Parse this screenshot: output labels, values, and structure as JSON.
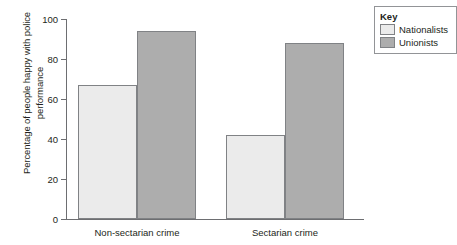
{
  "chart_data": {
    "type": "bar",
    "title": "",
    "xlabel": "",
    "ylabel": "Percentage of people happy with police performance",
    "categories": [
      "Non-sectarian crime",
      "Sectarian crime"
    ],
    "series": [
      {
        "name": "Nationalists",
        "values": [
          67,
          42
        ],
        "color": "#ebebeb"
      },
      {
        "name": "Unionists",
        "values": [
          94,
          88
        ],
        "color": "#adadad"
      }
    ],
    "ylim": [
      0,
      100
    ],
    "yticks": [
      0,
      20,
      40,
      60,
      80,
      100
    ],
    "ytick_labels": [
      "0",
      "20",
      "40",
      "60",
      "80",
      "100"
    ],
    "grid": false,
    "legend_position": "top-right"
  },
  "legend": {
    "title": "Key",
    "entries": [
      {
        "label": "Nationalists"
      },
      {
        "label": "Unionists"
      }
    ]
  }
}
